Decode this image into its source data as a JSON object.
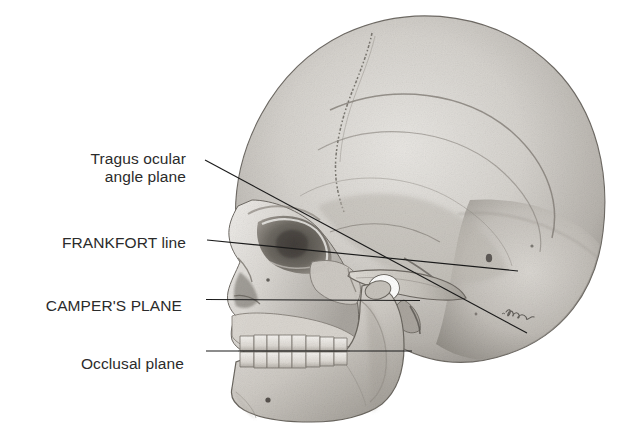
{
  "figure": {
    "background_color": "#ffffff",
    "label_color": "#2b2b2b",
    "line_color": "#1a1a1a",
    "width": 627,
    "height": 438
  },
  "labels": {
    "tragus": "Tragus ocular\nangle plane",
    "frankfort": "FRANKFORT line",
    "campers": "CAMPER'S PLANE",
    "occlusal": "Occlusal plane"
  },
  "leader_lines": [
    {
      "name": "tragus-ocular-angle-plane-line",
      "x1": 205,
      "y1": 160,
      "x2": 527,
      "y2": 333
    },
    {
      "name": "frankfort-line",
      "x1": 207,
      "y1": 240,
      "x2": 518,
      "y2": 271
    },
    {
      "name": "campers-plane-line",
      "x1": 206,
      "y1": 299,
      "x2": 420,
      "y2": 300
    },
    {
      "name": "occlusal-plane-line",
      "x1": 206,
      "y1": 351,
      "x2": 412,
      "y2": 351
    }
  ],
  "anatomy": {
    "parts": [
      "cranial-vault",
      "coronal-suture",
      "temporal-line",
      "frontal-bone",
      "parietal-bone",
      "occipital-bone",
      "temporal-bone",
      "orbit",
      "nasal-aperture",
      "zygomatic-arch",
      "external-auditory-meatus",
      "maxilla",
      "mandible",
      "maxillary-teeth",
      "mandibular-teeth",
      "mental-foramen",
      "artist-signature"
    ]
  }
}
